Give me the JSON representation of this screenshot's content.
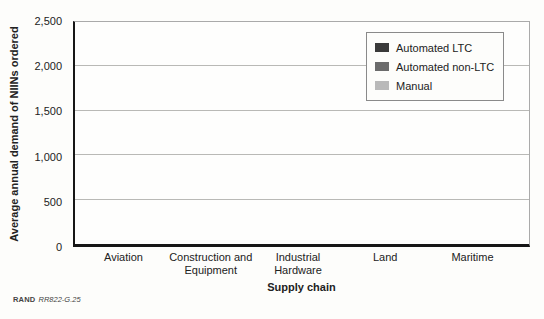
{
  "chart_data": {
    "type": "bar",
    "title": "",
    "xlabel": "Supply chain",
    "ylabel": "Average annual demand of NIINs ordered",
    "categories": [
      "Aviation",
      "Construction and Equipment",
      "Industrial Hardware",
      "Land",
      "Maritime"
    ],
    "series": [
      {
        "name": "Automated LTC",
        "color": "#3a3a3a",
        "values": [
          480,
          1450,
          2280,
          790,
          490
        ]
      },
      {
        "name": "Automated non-LTC",
        "color": "#6b6b6b",
        "values": [
          110,
          120,
          330,
          120,
          200
        ]
      },
      {
        "name": "Manual",
        "color": "#b9b9b9",
        "values": [
          130,
          1960,
          520,
          220,
          420
        ]
      }
    ],
    "ylim": [
      0,
      2500
    ],
    "yticks": [
      0,
      500,
      1000,
      1500,
      2000,
      2500
    ],
    "ytick_labels": [
      "0",
      "500",
      "1,000",
      "1,500",
      "2,000",
      "2,500"
    ],
    "grid": "horizontal",
    "legend_position": "top-right-inside"
  },
  "source": {
    "brand": "RAND",
    "figure_id": "RR822-G.25"
  }
}
